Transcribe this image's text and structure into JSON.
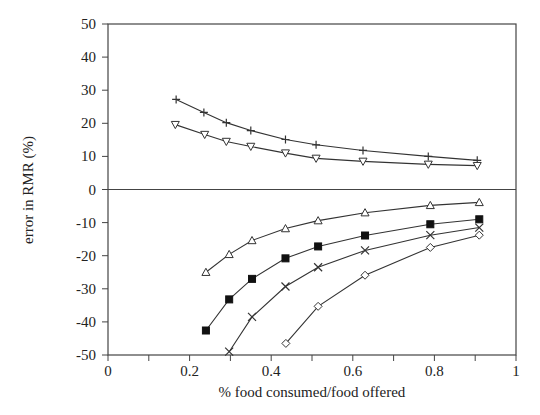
{
  "chart_data": {
    "type": "line",
    "title": "",
    "xlabel": "% food consumed/food offered",
    "ylabel": "error in RMR (%)",
    "xlim": [
      0,
      1
    ],
    "ylim": [
      -50,
      50
    ],
    "x_ticks": [
      0,
      0.2,
      0.4,
      0.6,
      0.8,
      1
    ],
    "x_tick_labels": [
      "0",
      "0.2",
      "0.4",
      "0.6",
      "0.8",
      "1"
    ],
    "x_minor_ticks": [
      0.1,
      0.3,
      0.5,
      0.7,
      0.9
    ],
    "y_ticks": [
      50,
      40,
      30,
      20,
      10,
      0,
      -10,
      -20,
      -30,
      -40,
      -50
    ],
    "y_tick_labels": [
      "50",
      "40",
      "30",
      "20",
      "10",
      "0",
      "-10",
      "-20",
      "-30",
      "-40",
      "-50"
    ],
    "grid": false,
    "zero_line": true,
    "legend": null,
    "series": [
      {
        "name": "plus",
        "marker": "plus",
        "x": [
          0.167,
          0.235,
          0.29,
          0.35,
          0.435,
          0.51,
          0.625,
          0.785,
          0.905
        ],
        "y": [
          27.2,
          23.3,
          20.2,
          17.8,
          15.1,
          13.5,
          11.8,
          10.0,
          8.8
        ]
      },
      {
        "name": "triangle-down",
        "marker": "triangle-down",
        "x": [
          0.165,
          0.237,
          0.29,
          0.35,
          0.435,
          0.51,
          0.625,
          0.785,
          0.905
        ],
        "y": [
          19.6,
          16.6,
          14.5,
          13.0,
          11.0,
          9.4,
          8.5,
          7.6,
          7.2
        ]
      },
      {
        "name": "triangle-up",
        "marker": "triangle-up",
        "x": [
          0.24,
          0.297,
          0.353,
          0.435,
          0.515,
          0.63,
          0.79,
          0.91
        ],
        "y": [
          -25.0,
          -19.6,
          -15.4,
          -11.8,
          -9.4,
          -7.0,
          -4.8,
          -3.9
        ]
      },
      {
        "name": "filled-square",
        "marker": "square-filled",
        "x": [
          0.24,
          0.297,
          0.353,
          0.435,
          0.515,
          0.63,
          0.79,
          0.91
        ],
        "y": [
          -42.6,
          -33.2,
          -27.0,
          -20.8,
          -17.2,
          -13.9,
          -10.5,
          -9.0
        ]
      },
      {
        "name": "cross",
        "marker": "x",
        "x": [
          0.297,
          0.353,
          0.435,
          0.515,
          0.63,
          0.79,
          0.91
        ],
        "y": [
          -49.0,
          -38.5,
          -29.3,
          -23.5,
          -18.4,
          -13.8,
          -11.5
        ]
      },
      {
        "name": "diamond",
        "marker": "diamond",
        "x": [
          0.436,
          0.515,
          0.63,
          0.79,
          0.91
        ],
        "y": [
          -46.5,
          -35.3,
          -25.9,
          -17.5,
          -13.8
        ]
      }
    ]
  },
  "colors": {
    "line": "#333333",
    "axis": "#444444",
    "text": "#222222"
  }
}
